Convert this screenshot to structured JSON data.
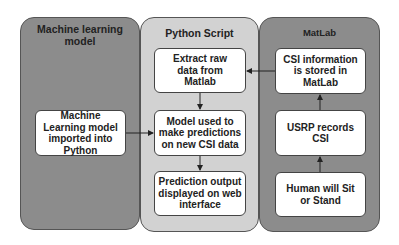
{
  "panels": {
    "ml": {
      "title": "Machine learning model",
      "boxes": [
        {
          "label": "Machine Learning model imported into Python"
        }
      ]
    },
    "python": {
      "title": "Python Script",
      "boxes": [
        {
          "label": "Extract raw data from Matlab"
        },
        {
          "label": "Model used to make predictions on new CSI data"
        },
        {
          "label": "Prediction output displayed on web interface"
        }
      ]
    },
    "matlab": {
      "title": "MatLab",
      "boxes": [
        {
          "label": "CSI information is stored in MatLab"
        },
        {
          "label": "USRP records CSI"
        },
        {
          "label": "Human will Sit or Stand"
        }
      ]
    }
  },
  "colors": {
    "dark_panel": "#8c8c8c",
    "light_panel": "#d2d2d2",
    "box": "#ffffff",
    "stroke": "#222222"
  }
}
